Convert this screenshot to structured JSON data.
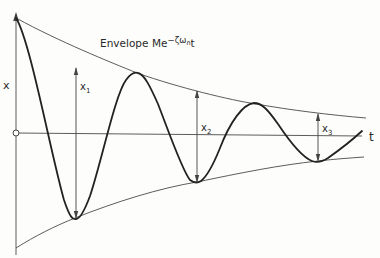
{
  "figure": {
    "axes": {
      "vertical_label": "x",
      "horizontal_label": "t",
      "origin_marker": "o"
    },
    "envelope": {
      "label": "Envelope",
      "expression_base": "Me",
      "expression_exponent": "−ζω",
      "expression_subscript": "n",
      "expression_tail": "t"
    },
    "amplitudes": [
      {
        "label": "x",
        "subscript": "1"
      },
      {
        "label": "x",
        "subscript": "2"
      },
      {
        "label": "x",
        "subscript": "3"
      }
    ],
    "colors": {
      "background": "#fdfdfb",
      "ink": "#222222",
      "thin_line": "#4a4a4a"
    }
  }
}
